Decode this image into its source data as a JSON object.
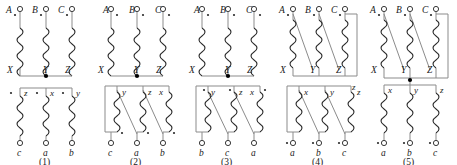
{
  "figure": {
    "count": 5,
    "colors": {
      "wire": "#8b8b8b",
      "coil": "#2b2b2b",
      "terminal": "#3a3a3a",
      "node": "#000000",
      "text": "#1a1a1a",
      "background": "#ffffff"
    }
  },
  "diagrams": [
    {
      "caption": "(1)",
      "primary": {
        "terminals": [
          "A",
          "B",
          "C"
        ],
        "ends": [
          "X",
          "Y",
          "Z"
        ],
        "connection": "wye",
        "neutral_dot": true,
        "polarity_marks": [
          "*",
          "*",
          "*"
        ],
        "polarity_position": "top"
      },
      "secondary": {
        "terminals": [
          "c",
          "a",
          "b"
        ],
        "starts": [
          "z",
          "x",
          "y"
        ],
        "connection": "wye",
        "polarity_marks": [
          "*",
          "*",
          "*"
        ],
        "polarity_position": "top",
        "crossed": false
      }
    },
    {
      "caption": "(2)",
      "primary": {
        "terminals": [
          "A",
          "B",
          "C"
        ],
        "ends": [
          "X",
          "Y",
          "Z"
        ],
        "connection": "wye",
        "neutral_dot": true,
        "polarity_marks": [
          "*",
          "*",
          "*"
        ],
        "polarity_position": "top"
      },
      "secondary": {
        "terminals": [
          "c",
          "a",
          "b"
        ],
        "starts": [
          "y",
          "z",
          "x"
        ],
        "connection": "delta",
        "polarity_marks": [
          "*",
          "*",
          "*"
        ],
        "polarity_position": "bottom",
        "crossed": true
      }
    },
    {
      "caption": "(3)",
      "primary": {
        "terminals": [
          "A",
          "B",
          "C"
        ],
        "ends": [
          "X",
          "Y",
          "Z"
        ],
        "connection": "wye",
        "neutral_dot": true,
        "polarity_marks": [
          "*",
          "*",
          "*"
        ],
        "polarity_position": "top"
      },
      "secondary": {
        "terminals": [
          "b",
          "c",
          "a"
        ],
        "starts": [
          "y",
          "z",
          "x"
        ],
        "connection": "delta",
        "polarity_marks": [
          "*",
          "*",
          "*"
        ],
        "polarity_position": "top",
        "crossed": true
      }
    },
    {
      "caption": "(4)",
      "primary": {
        "terminals": [
          "A",
          "B",
          "C"
        ],
        "ends": [
          "X",
          "Y",
          "Z"
        ],
        "connection": "delta",
        "neutral_dot": false,
        "polarity_marks": [
          "*",
          "*",
          "*"
        ],
        "polarity_position": "top"
      },
      "secondary": {
        "terminals": [
          "a",
          "b",
          "c"
        ],
        "starts": [
          "x",
          "y",
          "z"
        ],
        "connection": "delta",
        "polarity_marks": [
          "*",
          "*",
          "*"
        ],
        "polarity_position": "bottom",
        "crossed": true
      }
    },
    {
      "caption": "(5)",
      "primary": {
        "terminals": [
          "A",
          "B",
          "C"
        ],
        "ends": [
          "X",
          "Y",
          "Z"
        ],
        "connection": "delta",
        "neutral_dot": false,
        "polarity_marks": [
          "*",
          "*",
          "*"
        ],
        "polarity_position": "top"
      },
      "secondary": {
        "terminals": [
          "a",
          "b",
          "c"
        ],
        "starts": [
          "x",
          "y",
          "z"
        ],
        "connection": "wye",
        "neutral_dot": true,
        "polarity_marks": [
          "*",
          "*",
          "*"
        ],
        "polarity_position": "bottom",
        "crossed": false
      }
    }
  ],
  "stray_labels": [
    {
      "text": "z",
      "x": 355,
      "y": 88
    }
  ]
}
